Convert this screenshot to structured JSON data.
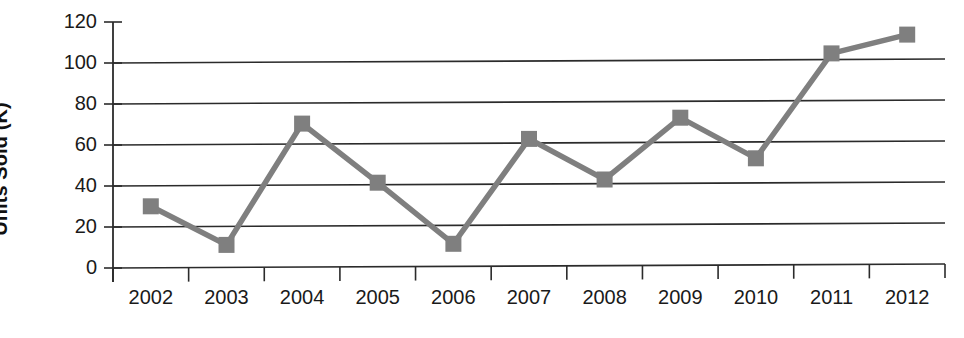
{
  "chart_data": {
    "type": "line",
    "title": "",
    "xlabel": "",
    "ylabel": "Units Sold (K)",
    "categories": [
      "2002",
      "2003",
      "2004",
      "2005",
      "2006",
      "2007",
      "2008",
      "2009",
      "2010",
      "2011",
      "2012"
    ],
    "values": [
      30,
      11,
      70,
      41,
      11,
      62,
      42,
      72,
      52,
      103,
      112
    ],
    "series": [
      {
        "name": "Units Sold (K)",
        "values": [
          30,
          11,
          70,
          41,
          11,
          62,
          42,
          72,
          52,
          103,
          112
        ]
      }
    ],
    "ylim": [
      0,
      120
    ],
    "ytick_labels": [
      "0",
      "20",
      "40",
      "60",
      "80",
      "100",
      "120"
    ],
    "ytick_values": [
      0,
      20,
      40,
      60,
      80,
      100,
      120
    ],
    "grid": true,
    "grid_axis": "y",
    "legend": false,
    "legend_position": "none",
    "marker": "square",
    "series_color": "#7f7f7f",
    "axis_color": "#2b2b2b",
    "background_color": "#ffffff"
  },
  "axis": {
    "y_title": "Units Sold (K)"
  }
}
